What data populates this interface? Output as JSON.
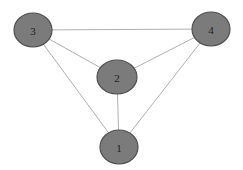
{
  "diagram": {
    "type": "undirected-graph",
    "colors": {
      "background": "#ffffff",
      "node_fill": "#7b7b7b",
      "node_stroke": "#4f4f4f",
      "edge": "#9a9a9a",
      "label": "#1e1e1e"
    },
    "nodes": [
      {
        "id": "1",
        "label": "1",
        "cx": 119,
        "cy": 147,
        "rx": 19,
        "ry": 17
      },
      {
        "id": "2",
        "label": "2",
        "cx": 117,
        "cy": 77,
        "rx": 20,
        "ry": 17
      },
      {
        "id": "3",
        "label": "3",
        "cx": 33,
        "cy": 30,
        "rx": 19,
        "ry": 17
      },
      {
        "id": "4",
        "label": "4",
        "cx": 211,
        "cy": 29,
        "rx": 19,
        "ry": 17
      }
    ],
    "edges": [
      {
        "from": "3",
        "to": "4"
      },
      {
        "from": "3",
        "to": "2"
      },
      {
        "from": "3",
        "to": "1"
      },
      {
        "from": "4",
        "to": "2"
      },
      {
        "from": "4",
        "to": "1"
      },
      {
        "from": "2",
        "to": "1"
      }
    ]
  }
}
